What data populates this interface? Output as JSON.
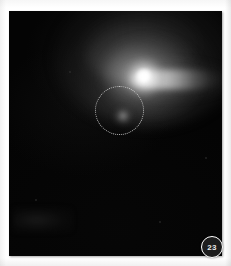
{
  "page": {
    "background_color": "#ffffff",
    "page_number_badge": "23"
  },
  "figure": {
    "name": "astronomical-field-image",
    "background_color": "#040404",
    "frame": {
      "x": 9,
      "y": 11,
      "width": 213,
      "height": 245
    },
    "objects": [
      {
        "id": "nucleus",
        "label": "bright-core",
        "type": "point-source",
        "center": [
          135,
          66
        ],
        "radius": 8,
        "peak_color": "#ffffff"
      },
      {
        "id": "jet",
        "label": "horizontal-jet-streak",
        "type": "elongated-emission",
        "start": [
          128,
          68
        ],
        "end": [
          205,
          69
        ],
        "thickness": 11,
        "peak_color": "#e6e6e6"
      },
      {
        "id": "halo",
        "label": "diffuse-nebulosity",
        "type": "extended-halo",
        "center": [
          139,
          46
        ],
        "width": 186,
        "height": 136,
        "color": "#969696"
      },
      {
        "id": "companion",
        "label": "faint-companion-source",
        "type": "point-source",
        "center": [
          114,
          105
        ],
        "radius": 5,
        "peak_color": "#c8c8c8"
      }
    ],
    "annotations": [
      {
        "id": "region-of-interest",
        "label": "dashed-circle-marker",
        "style": "dotted",
        "color": "#e1e1e1",
        "center": [
          110,
          99
        ],
        "diameter": 49
      }
    ]
  }
}
